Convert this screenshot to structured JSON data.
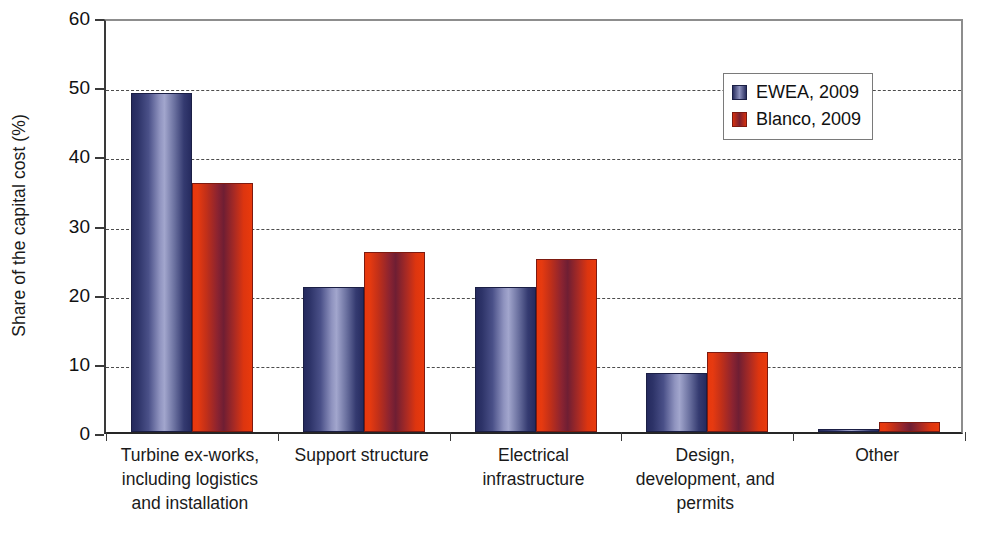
{
  "chart_data": {
    "type": "bar",
    "title": "",
    "xlabel": "",
    "ylabel": "Share of the capital cost (%)",
    "ylim": [
      0,
      60
    ],
    "ytick_step": 10,
    "yticks": [
      0,
      10,
      20,
      30,
      40,
      50,
      60
    ],
    "ytick_labels": [
      "0",
      "10",
      "20",
      "30",
      "40",
      "50",
      "60"
    ],
    "grid": "horizontal-dashed",
    "legend_position": "top-right",
    "categories": [
      "Turbine ex-works, including logistics and installation",
      "Support structure",
      "Electrical infrastructure",
      "Design, development, and permits",
      "Other"
    ],
    "category_lines": [
      [
        "Turbine ex-works,",
        "including logistics",
        "and installation"
      ],
      [
        "Support structure"
      ],
      [
        "Electrical",
        "infrastructure"
      ],
      [
        "Design,",
        "development, and",
        "permits"
      ],
      [
        "Other"
      ]
    ],
    "series": [
      {
        "name": "EWEA, 2009",
        "color": "#2a2f60",
        "values": [
          49,
          21,
          21,
          8.5,
          0.4
        ]
      },
      {
        "name": "Blanco, 2009",
        "color": "#d4300f",
        "values": [
          36,
          26,
          25,
          11.5,
          1.5
        ]
      }
    ]
  },
  "legend": {
    "items": [
      {
        "label": "EWEA, 2009",
        "swatch": "ewea-swatch"
      },
      {
        "label": "Blanco, 2009",
        "swatch": "blanco-swatch"
      }
    ]
  }
}
